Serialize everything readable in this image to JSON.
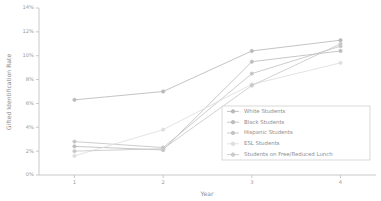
{
  "chart_data": {
    "type": "line",
    "title": "",
    "xlabel": "Year",
    "ylabel": "Gifted Identification Rate",
    "x": [
      1,
      2,
      3,
      4
    ],
    "xtick_labels": [
      "1",
      "2",
      "3",
      "4"
    ],
    "ytick_labels": [
      "0%",
      "2%",
      "4%",
      "6%",
      "8%",
      "10%",
      "12%",
      "14%"
    ],
    "ytick_values": [
      0,
      2,
      4,
      6,
      8,
      10,
      12,
      14
    ],
    "ylim": [
      0,
      14
    ],
    "xlim": [
      0.6,
      4.4
    ],
    "grid": false,
    "legend_position": "lower right",
    "series": [
      {
        "name": "White Students",
        "values": [
          6.3,
          7.0,
          10.4,
          11.3
        ],
        "color": "#b9b9b9",
        "marker": "circle"
      },
      {
        "name": "Black Students",
        "values": [
          2.4,
          2.1,
          9.5,
          10.4
        ],
        "color": "#bdbdbd",
        "marker": "circle"
      },
      {
        "name": "Hispanic Students",
        "values": [
          2.8,
          2.3,
          8.5,
          10.8
        ],
        "color": "#c4c4c4",
        "marker": "circle"
      },
      {
        "name": "ESL Students",
        "values": [
          1.6,
          3.8,
          7.6,
          9.4
        ],
        "color": "#dedede",
        "marker": "circle"
      },
      {
        "name": "Students on Free/Reduced Lunch",
        "values": [
          2.0,
          2.2,
          7.5,
          11.0
        ],
        "color": "#c9c9c9",
        "marker": "circle"
      }
    ]
  }
}
